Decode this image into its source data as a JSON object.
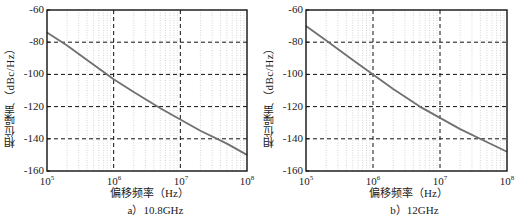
{
  "chart_data": [
    {
      "type": "line",
      "title": "a) 10.8GHz",
      "xlabel": "偏移频率（Hz）",
      "ylabel": "相位噪声（dBc/Hz）",
      "xscale": "log",
      "xlim": [
        100000,
        100000000
      ],
      "ylim": [
        -160,
        -60
      ],
      "xticks": [
        "10^5",
        "10^6",
        "10^7",
        "10^8"
      ],
      "yticks": [
        -60,
        -80,
        -100,
        -120,
        -140,
        -160
      ],
      "grid": true,
      "series": [
        {
          "name": "phase noise 10.8GHz",
          "x": [
            100000,
            200000,
            500000,
            1000000,
            2000000,
            5000000,
            10000000,
            20000000,
            50000000,
            100000000
          ],
          "y": [
            -74,
            -82,
            -94,
            -103,
            -111,
            -121,
            -128,
            -135,
            -143,
            -150
          ]
        }
      ]
    },
    {
      "type": "line",
      "title": "b) 12GHz",
      "xlabel": "偏移频率（Hz）",
      "ylabel": "相位噪声（dBc/Hz）",
      "xscale": "log",
      "xlim": [
        100000,
        100000000
      ],
      "ylim": [
        -160,
        -60
      ],
      "xticks": [
        "10^5",
        "10^6",
        "10^7",
        "10^8"
      ],
      "yticks": [
        -60,
        -80,
        -100,
        -120,
        -140,
        -160
      ],
      "grid": true,
      "series": [
        {
          "name": "phase noise 12GHz",
          "x": [
            100000,
            200000,
            500000,
            1000000,
            2000000,
            5000000,
            10000000,
            20000000,
            50000000,
            100000000
          ],
          "y": [
            -70,
            -79,
            -91,
            -100,
            -109,
            -120,
            -127,
            -134,
            -142,
            -148
          ]
        }
      ]
    }
  ],
  "panels": [
    {
      "ylabel": "相位噪声（dBc/Hz）",
      "xlabel": "偏移频率（Hz）",
      "caption": "a）10.8GHz",
      "yticks": [
        "-60",
        "-80",
        "-100",
        "-120",
        "-140",
        "-160"
      ],
      "xticks": [
        {
          "base": "10",
          "exp": "5"
        },
        {
          "base": "10",
          "exp": "6"
        },
        {
          "base": "10",
          "exp": "7"
        },
        {
          "base": "10",
          "exp": "8"
        }
      ]
    },
    {
      "ylabel": "相位噪声（dBc/Hz）",
      "xlabel": "偏移频率（Hz）",
      "caption": "b）12GHz",
      "yticks": [
        "-60",
        "-80",
        "-100",
        "-120",
        "-140",
        "-160"
      ],
      "xticks": [
        {
          "base": "10",
          "exp": "5"
        },
        {
          "base": "10",
          "exp": "6"
        },
        {
          "base": "10",
          "exp": "7"
        },
        {
          "base": "10",
          "exp": "8"
        }
      ]
    }
  ],
  "colors": {
    "line": "#707070",
    "frame": "#111111",
    "major_grid": "#111111",
    "minor_grid": "#b8b8b8"
  }
}
